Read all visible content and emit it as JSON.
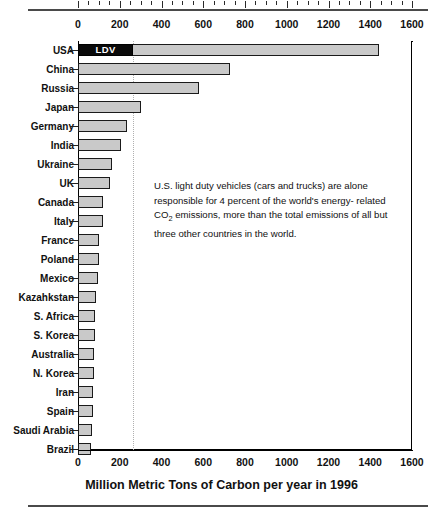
{
  "chart_data": {
    "type": "bar",
    "orientation": "horizontal",
    "title": "",
    "xlabel": "Million Metric Tons of Carbon per year in 1996",
    "ylabel": "",
    "xlim": [
      0,
      1600
    ],
    "xticks": [
      0,
      200,
      400,
      600,
      800,
      1000,
      1200,
      1400,
      1600
    ],
    "xtick_labels": [
      "0",
      "200",
      "400",
      "600",
      "800",
      "1000",
      "1200",
      "1400",
      "1600"
    ],
    "minor_tick_step": 50,
    "grid": false,
    "axis_positions": [
      "top",
      "bottom"
    ],
    "categories": [
      "USA",
      "China",
      "Russia",
      "Japan",
      "Germany",
      "India",
      "Ukraine",
      "UK",
      "Canada",
      "Italy",
      "France",
      "Poland",
      "Mexico",
      "Kazahkstan",
      "S. Africa",
      "S. Korea",
      "Australia",
      "N. Korea",
      "Iran",
      "Spain",
      "Saudi Arabia",
      "Brazil"
    ],
    "values": [
      1440,
      730,
      580,
      300,
      235,
      205,
      165,
      155,
      118,
      118,
      102,
      100,
      95,
      85,
      82,
      80,
      78,
      76,
      72,
      70,
      66,
      63
    ],
    "segments": {
      "USA": {
        "ldv_label": "LDV",
        "ldv_value": 265,
        "total_value": 1440
      }
    },
    "reference_line": {
      "value": 265,
      "style": "dotted",
      "color": "#b0b0b0"
    },
    "colors": {
      "bar_fill": "#c9c9c9",
      "bar_border": "#1a1a1a",
      "ldv_fill": "#0a0a0a",
      "ldv_text": "#ffffff",
      "axis": "#000000",
      "text": "#111111",
      "rule": "#4a4a4a"
    },
    "annotation": {
      "line1": "U.S. light duty vehicles (cars and trucks) are alone",
      "line2": "responsible for 4 percent of the world's energy-",
      "line3_pre": "related CO",
      "line3_sub": "2",
      "line3_post": " emissions, more than the total emissions of",
      "line4": "all but three other countries in the world."
    }
  }
}
